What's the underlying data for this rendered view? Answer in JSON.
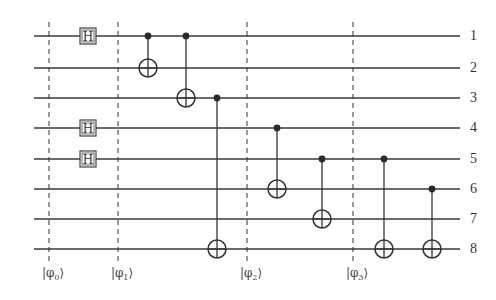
{
  "circuit": {
    "wire_x_start": 34,
    "wire_x_end": 460,
    "wires": [
      {
        "label": "1",
        "y": 36
      },
      {
        "label": "2",
        "y": 68
      },
      {
        "label": "3",
        "y": 98
      },
      {
        "label": "4",
        "y": 128
      },
      {
        "label": "5",
        "y": 159
      },
      {
        "label": "6",
        "y": 189
      },
      {
        "label": "7",
        "y": 219
      },
      {
        "label": "8",
        "y": 249
      }
    ],
    "hadamard_gates": [
      {
        "label": "H",
        "wire": 1,
        "x": 88
      },
      {
        "label": "H",
        "wire": 4,
        "x": 88
      },
      {
        "label": "H",
        "wire": 5,
        "x": 88
      }
    ],
    "cnot_gates": [
      {
        "control": 1,
        "target": 2,
        "x": 148
      },
      {
        "control": 1,
        "target": 3,
        "x": 186
      },
      {
        "control": 3,
        "target": 8,
        "x": 217
      },
      {
        "control": 4,
        "target": 6,
        "x": 277
      },
      {
        "control": 5,
        "target": 7,
        "x": 322
      },
      {
        "control": 5,
        "target": 8,
        "x": 384
      },
      {
        "control": 6,
        "target": 8,
        "x": 432
      }
    ],
    "barriers": [
      {
        "x": 49,
        "label": "|φ",
        "sub": "0",
        "close": "⟩"
      },
      {
        "x": 118,
        "label": "|φ",
        "sub": "1",
        "close": "⟩"
      },
      {
        "x": 247,
        "label": "|φ",
        "sub": "2",
        "close": "⟩"
      },
      {
        "x": 353,
        "label": "|φ",
        "sub": "3",
        "close": "⟩"
      }
    ],
    "barrier_y_top": 22,
    "barrier_y_bottom": 262,
    "label_y": 266
  }
}
